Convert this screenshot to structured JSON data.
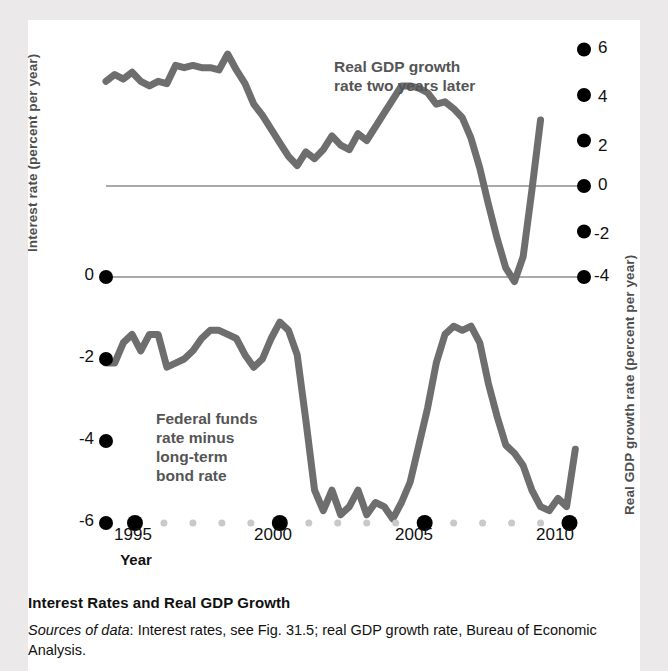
{
  "figure": {
    "caption_title": "Interest Rates and Real GDP Growth",
    "source_prefix": "Sources of data",
    "source_text": ": Interest rates, see Fig. 31.5; real GDP growth rate, Bureau of Economic Analysis."
  },
  "colors": {
    "curve": "#6e6e6e",
    "reference_line": "#a9a9a9",
    "tick_dot_major": "#000000",
    "tick_dot_minor": "#c9c9c9",
    "axis_title": "#4e4e4e",
    "annotation": "#555555",
    "panel": "#ffffff",
    "page_background": "#ebe9e9"
  },
  "chart_data": {
    "type": "line",
    "title": "Interest Rates and Real GDP Growth",
    "xlabel": "Year",
    "ylabel": "Interest rate (percent per year)",
    "y2label": "Real GDP growth rate (percent per year)",
    "grid": false,
    "legend": "annotations-on-plot",
    "xlim": [
      1994,
      2010.5
    ],
    "xticks": [
      1995,
      2000,
      2005,
      2010
    ],
    "xtick_labels": [
      "1995",
      "2000",
      "2005",
      "2010"
    ],
    "ylim": [
      -6,
      0.6
    ],
    "yticks": [
      0,
      -2,
      -4,
      -6
    ],
    "ytick_labels": [
      "0",
      "-2",
      "-4",
      "-6"
    ],
    "y2lim": [
      -4.7,
      6.6
    ],
    "y2ticks": [
      6,
      4,
      2,
      0,
      -2,
      -4
    ],
    "y2tick_labels": [
      "6",
      "4",
      "2",
      "0",
      "-2",
      "-4"
    ],
    "reference_lines": [
      {
        "axis": "right",
        "value": 0
      },
      {
        "axis": "both",
        "value_left": 0,
        "value_right": -4
      }
    ],
    "series": [
      {
        "name": "Real GDP growth rate two years later",
        "axis": "right",
        "annotation": "Real GDP growth rate two years later",
        "x": [
          1994.0,
          1994.3,
          1994.6,
          1994.9,
          1995.2,
          1995.5,
          1995.8,
          1996.1,
          1996.4,
          1996.7,
          1997.0,
          1997.3,
          1997.6,
          1997.9,
          1998.2,
          1998.5,
          1998.8,
          1999.1,
          1999.4,
          1999.7,
          2000.0,
          2000.3,
          2000.6,
          2000.9,
          2001.2,
          2001.5,
          2001.8,
          2002.1,
          2002.4,
          2002.7,
          2003.0,
          2003.3,
          2003.6,
          2003.9,
          2004.2,
          2004.5,
          2004.8,
          2005.1,
          2005.4,
          2005.7,
          2006.0,
          2006.3,
          2006.6,
          2006.9,
          2007.2,
          2007.5,
          2007.8,
          2008.1,
          2008.4,
          2008.7,
          2009.0
        ],
        "y": [
          4.6,
          4.9,
          4.7,
          5.0,
          4.6,
          4.4,
          4.6,
          4.5,
          5.3,
          5.2,
          5.3,
          5.2,
          5.2,
          5.1,
          5.8,
          5.1,
          4.5,
          3.6,
          3.1,
          2.5,
          1.9,
          1.3,
          0.9,
          1.5,
          1.2,
          1.6,
          2.2,
          1.8,
          1.6,
          2.3,
          2.0,
          2.6,
          3.2,
          3.8,
          4.4,
          4.4,
          4.3,
          4.1,
          3.6,
          3.7,
          3.4,
          3.0,
          2.1,
          0.8,
          -0.8,
          -2.3,
          -3.6,
          -4.2,
          -3.1,
          -0.2,
          2.9
        ]
      },
      {
        "name": "Federal funds rate minus long-term bond rate",
        "axis": "left",
        "annotation": "Federal funds rate minus long-term bond rate",
        "x": [
          1994.0,
          1994.3,
          1994.6,
          1994.9,
          1995.2,
          1995.5,
          1995.8,
          1996.1,
          1996.4,
          1996.7,
          1997.0,
          1997.3,
          1997.6,
          1997.9,
          1998.2,
          1998.5,
          1998.8,
          1999.1,
          1999.4,
          1999.7,
          2000.0,
          2000.3,
          2000.6,
          2000.9,
          2001.2,
          2001.5,
          2001.8,
          2002.1,
          2002.4,
          2002.7,
          2003.0,
          2003.3,
          2003.6,
          2003.9,
          2004.2,
          2004.5,
          2004.8,
          2005.1,
          2005.4,
          2005.7,
          2006.0,
          2006.3,
          2006.6,
          2006.9,
          2007.2,
          2007.5,
          2007.8,
          2008.1,
          2008.4,
          2008.7,
          2009.0,
          2009.3,
          2009.6,
          2009.9,
          2010.2
        ],
        "y": [
          -2.1,
          -2.1,
          -1.6,
          -1.4,
          -1.8,
          -1.4,
          -1.4,
          -2.2,
          -2.1,
          -2.0,
          -1.8,
          -1.5,
          -1.3,
          -1.3,
          -1.4,
          -1.5,
          -1.9,
          -2.2,
          -2.0,
          -1.5,
          -1.1,
          -1.3,
          -1.9,
          -3.5,
          -5.2,
          -5.7,
          -5.2,
          -5.8,
          -5.6,
          -5.2,
          -5.8,
          -5.5,
          -5.6,
          -5.9,
          -5.5,
          -5.0,
          -4.1,
          -3.2,
          -2.1,
          -1.4,
          -1.2,
          -1.3,
          -1.2,
          -1.6,
          -2.6,
          -3.4,
          -4.1,
          -4.3,
          -4.6,
          -5.2,
          -5.6,
          -5.7,
          -5.4,
          -5.6,
          -4.2
        ]
      }
    ]
  },
  "axes": {
    "left_title": "Interest rate (percent per year)",
    "right_title": "Real GDP growth rate (percent per year)",
    "x_title": "Year",
    "left_ticks": [
      "0",
      "-2",
      "-4",
      "-6"
    ],
    "right_ticks": [
      "6",
      "4",
      "2",
      "0",
      "-2",
      "-4"
    ],
    "x_ticks": [
      "1995",
      "2000",
      "2005",
      "2010"
    ]
  },
  "annotations": {
    "gdp_line1": "Real GDP growth",
    "gdp_line2": "rate two years later",
    "ffr_line1": "Federal funds",
    "ffr_line2": "rate minus",
    "ffr_line3": "long-term",
    "ffr_line4": "bond rate"
  }
}
